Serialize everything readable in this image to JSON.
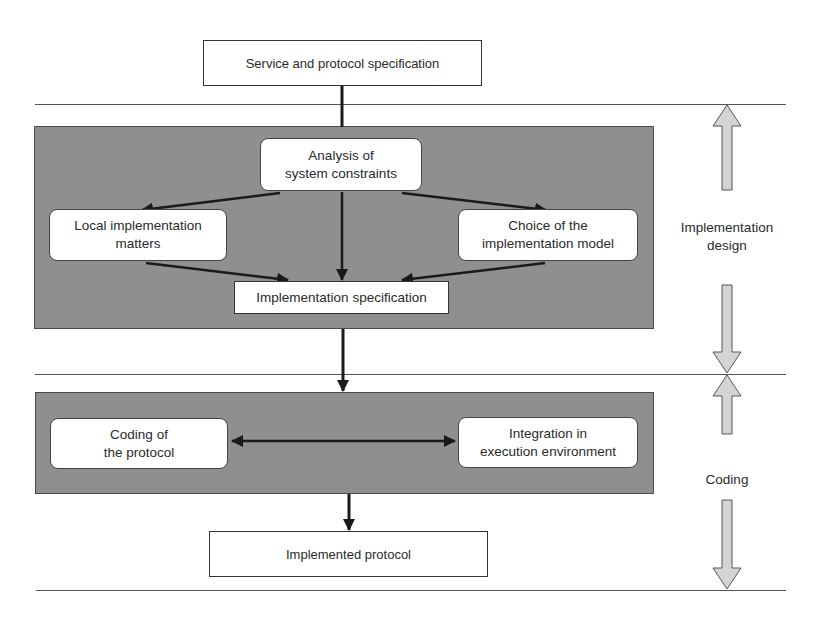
{
  "diagram": {
    "top_box": {
      "label": "Service and protocol specification"
    },
    "design_panel": {
      "analysis": {
        "line1": "Analysis of",
        "line2": "system constraints"
      },
      "local": {
        "line1": "Local implementation",
        "line2": "matters"
      },
      "choice": {
        "line1": "Choice of the",
        "line2": "implementation model"
      },
      "impl_spec": {
        "label": "Implementation specification"
      }
    },
    "coding_panel": {
      "coding": {
        "line1": "Coding of",
        "line2": "the protocol"
      },
      "integration": {
        "line1": "Integration in",
        "line2": "execution environment"
      }
    },
    "bottom_box": {
      "label": "Implemented protocol"
    },
    "phases": {
      "design": {
        "line1": "Implementation",
        "line2": "design"
      },
      "coding": {
        "label": "Coding"
      }
    },
    "colors": {
      "panel": "#8f8f8f",
      "phase_arrow": "#d4d4d4",
      "arrow": "#1a1a1a"
    }
  }
}
